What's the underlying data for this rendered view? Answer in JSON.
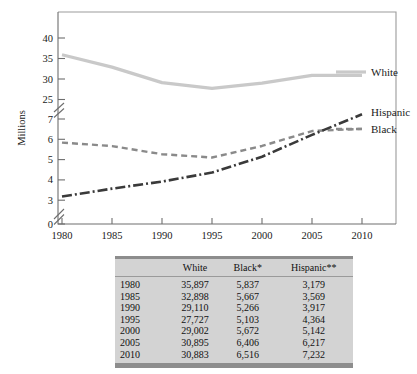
{
  "chart_data": {
    "type": "line",
    "title": "",
    "xlabel": "",
    "ylabel": "Millions",
    "x": [
      1980,
      1985,
      1990,
      1995,
      2000,
      2005,
      2010
    ],
    "xlim": [
      1980,
      2013
    ],
    "xticks": [
      "1980",
      "1985",
      "1990",
      "1995",
      "2000",
      "2005",
      "2010"
    ],
    "yticks_lower": [
      "0",
      "3",
      "4",
      "5",
      "6",
      "7"
    ],
    "yticks_upper": [
      "25",
      "30",
      "35",
      "40"
    ],
    "y_axis_breaks": [
      "between 0 and 3",
      "between 7 and 25"
    ],
    "grid": false,
    "legend_position": "right-inline",
    "series": [
      {
        "name": "White",
        "label": "White",
        "color": "#c9c9c9",
        "style": "solid",
        "values": [
          35.897,
          32.898,
          29.11,
          27.727,
          29.002,
          30.895,
          30.883
        ]
      },
      {
        "name": "Black",
        "label": "Black",
        "color": "#8a8a8a",
        "style": "dashed",
        "values": [
          5.837,
          5.667,
          5.266,
          5.103,
          5.672,
          6.406,
          6.516
        ]
      },
      {
        "name": "Hispanic",
        "label": "Hispanic",
        "color": "#3a3a3a",
        "style": "dash-dot",
        "values": [
          3.179,
          3.569,
          3.917,
          4.364,
          5.142,
          6.217,
          7.232
        ]
      }
    ]
  },
  "table": {
    "columns": [
      "",
      "White",
      "Black*",
      "Hispanic**"
    ],
    "rows": [
      {
        "year": "1980",
        "white": "35,897",
        "black": "5,837",
        "hispanic": "3,179"
      },
      {
        "year": "1985",
        "white": "32,898",
        "black": "5,667",
        "hispanic": "3,569"
      },
      {
        "year": "1990",
        "white": "29,110",
        "black": "5,266",
        "hispanic": "3,917"
      },
      {
        "year": "1995",
        "white": "27,727",
        "black": "5,103",
        "hispanic": "4,364"
      },
      {
        "year": "2000",
        "white": "29,002",
        "black": "5,672",
        "hispanic": "5,142"
      },
      {
        "year": "2005",
        "white": "30,895",
        "black": "6,406",
        "hispanic": "6,217"
      },
      {
        "year": "2010",
        "white": "30,883",
        "black": "6,516",
        "hispanic": "7,232"
      }
    ]
  }
}
